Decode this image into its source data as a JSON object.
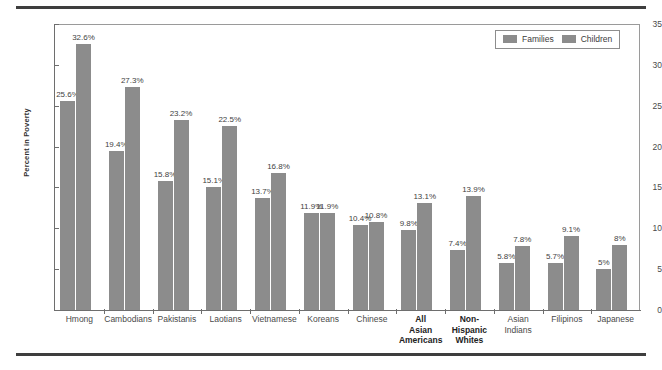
{
  "chart_data": {
    "type": "bar",
    "title": "",
    "xlabel": "",
    "ylabel": "Percent in Poverty",
    "ylim": [
      0,
      35
    ],
    "yticks": [
      0,
      5,
      10,
      15,
      20,
      25,
      30,
      35
    ],
    "grid": false,
    "legend_position": "top-right",
    "legend": [
      "Families",
      "Children"
    ],
    "categories": [
      "Hmong",
      "Cambodians",
      "Pakistanis",
      "Laotians",
      "Vietnamese",
      "Koreans",
      "Chinese",
      "All\nAsian\nAmericans",
      "Non-\nHispanic\nWhites",
      "Asian\nIndians",
      "Filipinos",
      "Japanese"
    ],
    "categories_emphasis": [
      false,
      false,
      false,
      false,
      false,
      false,
      false,
      true,
      true,
      false,
      false,
      false
    ],
    "series": [
      {
        "name": "Families",
        "values": [
          25.6,
          19.4,
          15.8,
          15.1,
          13.7,
          11.9,
          10.4,
          9.8,
          7.4,
          5.8,
          5.7,
          5.0
        ],
        "labels": [
          "25.6%",
          "19.4%",
          "15.8%",
          "15.1%",
          "13.7%",
          "11.9%",
          "10.4%",
          "9.8%",
          "7.4%",
          "5.8%",
          "5.7%",
          "5%"
        ]
      },
      {
        "name": "Children",
        "values": [
          32.6,
          27.3,
          23.2,
          22.5,
          16.8,
          11.9,
          10.8,
          13.1,
          13.9,
          7.8,
          9.1,
          8.0
        ],
        "labels": [
          "32.6%",
          "27.3%",
          "23.2%",
          "22.5%",
          "16.8%",
          "11.9%",
          "10.8%",
          "13.1%",
          "13.9%",
          "7.8%",
          "9.1%",
          "8%"
        ]
      }
    ],
    "colors": {
      "bar": "#8c8c8c",
      "axis": "#6e6e6e",
      "text": "#3f3f3f",
      "rule": "#3e3e3e"
    }
  }
}
